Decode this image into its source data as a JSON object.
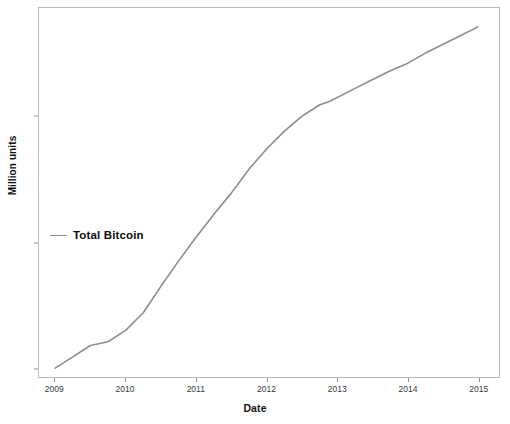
{
  "chart_data": {
    "type": "line",
    "title": "",
    "xlabel": "Date",
    "ylabel": "Million units",
    "xlim": [
      2008.77,
      2015.3
    ],
    "ylim": [
      -0.35,
      14.3
    ],
    "grid": false,
    "legend_position": "inside-left",
    "series": [
      {
        "name": "Total Bitcoin",
        "color": "#8c8c8c",
        "x": [
          2009.0,
          2009.25,
          2009.5,
          2009.75,
          2010.0,
          2010.25,
          2010.5,
          2010.75,
          2011.0,
          2011.25,
          2011.5,
          2011.75,
          2012.0,
          2012.25,
          2012.5,
          2012.75,
          2012.9,
          2013.25,
          2013.5,
          2013.75,
          2014.0,
          2014.25,
          2014.5,
          2014.75,
          2015.0
        ],
        "y": [
          0.0,
          0.45,
          0.9,
          1.05,
          1.5,
          2.2,
          3.25,
          4.25,
          5.2,
          6.1,
          6.95,
          7.9,
          8.7,
          9.4,
          10.0,
          10.45,
          10.6,
          11.1,
          11.45,
          11.8,
          12.1,
          12.5,
          12.85,
          13.2,
          13.55
        ]
      }
    ],
    "x_ticks": [
      {
        "value": 2009,
        "label": "2009"
      },
      {
        "value": 2010,
        "label": "2010"
      },
      {
        "value": 2011,
        "label": "2011"
      },
      {
        "value": 2012,
        "label": "2012"
      },
      {
        "value": 2013,
        "label": "2013"
      },
      {
        "value": 2014,
        "label": "2014"
      },
      {
        "value": 2015,
        "label": "2015"
      }
    ],
    "y_ticks": [
      {
        "value": 0,
        "label": "0"
      },
      {
        "value": 5,
        "label": "5"
      },
      {
        "value": 10,
        "label": "10"
      }
    ],
    "legend_entries": [
      {
        "label": "Total Bitcoin",
        "color": "#8c8c8c"
      }
    ]
  },
  "colors": {
    "line": "#8c8c8c",
    "panel_border": "#b9b9b9",
    "tick": "#8f8f8f",
    "text": "#111111",
    "background": "#ffffff"
  }
}
